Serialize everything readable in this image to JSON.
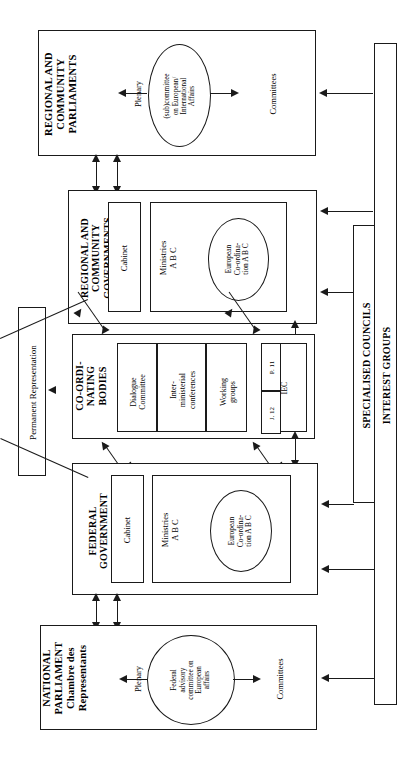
{
  "diagram": {
    "orientation": "rotated-90",
    "ink_color": "#1a1a1a",
    "background": "#ffffff"
  },
  "blocks": {
    "regional_parliaments": {
      "heading": "REGIONAL AND\nCOMMUNITY\nPARLIAMENTS",
      "plenary": "Plenary",
      "committees": "Committees",
      "oval": "(sub)committee\non European/\nInternational\nAffairs"
    },
    "regional_governments": {
      "heading": "REGIONAL AND\nCOMMUNITY\nGOVERNMENTS",
      "cabinet": "Cabinet",
      "ministries": "Ministries\nA  B  C",
      "oval": "European\nCo-ordina-\ntion A B C"
    },
    "coordinating_bodies": {
      "heading": "CO-ORDI-\nNATING\nBODIES",
      "dialogue_committee": "Dialogue\nCommittee",
      "interministerial_conferences": "Inter-\nministerial\nconferences",
      "working_groups": "Working\ngroups",
      "iec": "IEC",
      "iec_sub_a": "P. 11",
      "iec_sub_b": "J. 12"
    },
    "federal_government": {
      "heading": "FEDERAL\nGOVERNMENT",
      "cabinet": "Cabinet",
      "ministries": "Ministries\nA  B  C",
      "oval": "European\nCo-ordina-\ntion A B C"
    },
    "national_parliament": {
      "heading": "NATIONAL\nPARLIAMENT\nChambre des\nRepresentants",
      "plenary": "Plenary",
      "committees": "Committees",
      "oval": "Federal\nadvisory\ncommittee on\nEuropean\naffairs"
    },
    "permanent_representation": {
      "label": "Permanent Representation"
    },
    "specialised_councils": {
      "label": "SPECIALISED COUNCILS"
    },
    "interest_groups": {
      "label": "INTEREST GROUPS"
    }
  }
}
